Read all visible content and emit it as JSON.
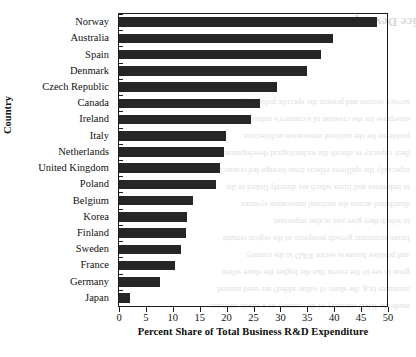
{
  "chart_data": {
    "type": "bar",
    "orientation": "horizontal",
    "title": "",
    "xlabel": "Percent Share of Total Business R&D Expenditure",
    "ylabel": "Country",
    "xlim": [
      0,
      50
    ],
    "xticks": [
      0,
      5,
      10,
      15,
      20,
      25,
      30,
      35,
      40,
      45,
      50
    ],
    "grid": false,
    "legend": null,
    "bar_color": "#262626",
    "axis_color": "#1a1a1a",
    "categories": [
      "Norway",
      "Australia",
      "Spain",
      "Denmark",
      "Czech Republic",
      "Canada",
      "Ireland",
      "Italy",
      "Netherlands",
      "United Kingdom",
      "Poland",
      "Belgium",
      "Korea",
      "Finland",
      "Sweden",
      "France",
      "Germany",
      "Japan"
    ],
    "values": [
      48.0,
      39.8,
      37.6,
      35.0,
      29.4,
      26.3,
      24.5,
      19.9,
      19.6,
      18.7,
      18.0,
      13.7,
      12.6,
      12.4,
      11.5,
      10.5,
      7.7,
      2.0
    ]
  },
  "ghost_text": {
    "title": "ice Development",
    "lines": [
      "made the R&D intensity of the country as a whole increase.",
      "measures (e.g. the share of value added) are used instead",
      "great to see to the extent that the higher the share when",
      "and positive business sector R&D in the country.",
      "future economic growth prospects of the region remain",
      "to which they give rise is also important.",
      "distributed across the national innovation systems.",
      "in industries and firms which are directly linked to the",
      "especially the spillover effects from foreign-led research",
      "their capacity to absorb the technological developments.",
      "problems for the national innovation architecture.",
      "enterprise for the creation of a country's industrial",
      "service sectors and present the specific policy approach"
    ]
  }
}
